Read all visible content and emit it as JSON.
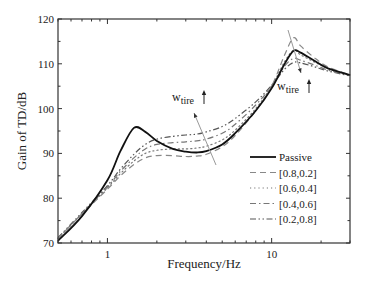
{
  "chart_data": {
    "type": "line",
    "title": "",
    "xlabel": "Frequency/Hz",
    "ylabel": "Gain of TD/dB",
    "xscale": "log",
    "xlim": [
      0.5,
      30
    ],
    "ylim": [
      70,
      120
    ],
    "xticks": [
      1,
      10
    ],
    "xtick_labels": [
      "1",
      "10"
    ],
    "yticks": [
      70,
      80,
      90,
      100,
      110,
      120
    ],
    "ytick_labels": [
      "70",
      "80",
      "90",
      "100",
      "110",
      "120"
    ],
    "grid": false,
    "legend_position": "lower right",
    "legend": [
      "Passive",
      "[0.8,0.2]",
      "[0.6,0.4]",
      "[0.4,0.6]",
      "[0.2,0.8]"
    ],
    "annotations": [
      {
        "text": "w",
        "sub": "tire",
        "arrow": "up",
        "near_frequency": 3.5,
        "near_gain": 103
      },
      {
        "text": "w",
        "sub": "tire",
        "arrow": "up",
        "near_frequency": 15,
        "near_gain": 110
      }
    ],
    "x": [
      0.5,
      0.7,
      1.0,
      1.2,
      1.45,
      1.7,
      2.0,
      2.5,
      3.0,
      3.5,
      4.0,
      5.0,
      6.0,
      8.0,
      10.0,
      12.0,
      13.6,
      15.0,
      18.0,
      22.0,
      30.0
    ],
    "series": [
      {
        "name": "Passive",
        "style": "solid",
        "color": "#111111",
        "values": [
          70.5,
          76.0,
          84.0,
          90.5,
          95.7,
          94.8,
          92.8,
          91.0,
          90.4,
          90.2,
          90.5,
          92.0,
          94.5,
          99.5,
          104.5,
          110.0,
          112.9,
          112.5,
          110.8,
          109.0,
          107.5
        ]
      },
      {
        "name": "[0.8,0.2]",
        "style": "dashed",
        "color": "#888888",
        "values": [
          71.0,
          76.5,
          82.0,
          85.0,
          87.5,
          89.0,
          89.5,
          89.5,
          89.3,
          89.4,
          89.8,
          91.5,
          94.0,
          99.5,
          105.0,
          112.0,
          115.8,
          114.0,
          111.5,
          109.3,
          107.5
        ]
      },
      {
        "name": "[0.6,0.4]",
        "style": "dotted",
        "color": "#777777",
        "values": [
          71.0,
          76.5,
          82.3,
          85.5,
          88.3,
          90.0,
          90.7,
          91.0,
          91.0,
          91.2,
          91.6,
          93.0,
          95.2,
          100.0,
          105.0,
          110.5,
          113.0,
          112.0,
          110.5,
          109.0,
          107.5
        ]
      },
      {
        "name": "[0.4,0.6]",
        "style": "dashdot",
        "color": "#777777",
        "values": [
          71.0,
          76.6,
          82.5,
          86.0,
          89.0,
          91.0,
          92.0,
          92.4,
          92.6,
          92.8,
          93.2,
          94.5,
          96.5,
          100.8,
          105.0,
          109.5,
          111.2,
          110.8,
          109.8,
          108.6,
          107.4
        ]
      },
      {
        "name": "[0.2,0.8]",
        "style": "dashdotdot",
        "color": "#555555",
        "values": [
          71.2,
          76.8,
          82.8,
          86.5,
          89.8,
          92.0,
          93.2,
          93.8,
          94.1,
          94.3,
          94.8,
          96.0,
          97.8,
          101.5,
          105.2,
          108.8,
          110.3,
          110.2,
          109.4,
          108.4,
          107.3
        ]
      }
    ]
  }
}
